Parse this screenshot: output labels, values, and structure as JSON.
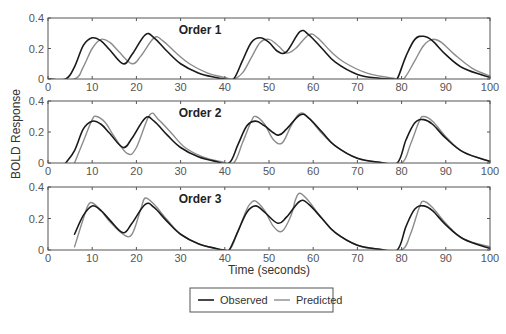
{
  "chart_data": {
    "type": "line",
    "ylabel": "BOLD Response",
    "xlabel": "Time (seconds)",
    "xlim": [
      0,
      100
    ],
    "ylim": [
      0,
      0.4
    ],
    "xticks": [
      0,
      10,
      20,
      30,
      40,
      50,
      60,
      70,
      80,
      90,
      100
    ],
    "xtick_labels": [
      "0",
      "10",
      "20",
      "30",
      "40",
      "50",
      "60",
      "70",
      "80",
      "90",
      "100"
    ],
    "yticks": [
      0,
      0.2,
      0.4
    ],
    "ytick_labels": [
      "0",
      "0.2",
      "0.4"
    ],
    "grid": false,
    "legend": {
      "position": "bottom-center",
      "entries": [
        {
          "label": "Observed",
          "color": "#1a1a1a"
        },
        {
          "label": "Predicted",
          "color": "#8c8c8c"
        }
      ]
    },
    "panels": [
      {
        "title": "Order 1",
        "series": [
          {
            "name": "Observed",
            "color": "#1a1a1a",
            "x": [
              0,
              4,
              6,
              8,
              10,
              12,
              14,
              17,
              19,
              22,
              24,
              27,
              30,
              34,
              38,
              40,
              42,
              44,
              46,
              48,
              50,
              52,
              54,
              57,
              59,
              62,
              65,
              70,
              75,
              78,
              79,
              81,
              83,
              85,
              87,
              90,
              94,
              100
            ],
            "y": [
              0,
              0,
              0.08,
              0.22,
              0.27,
              0.25,
              0.19,
              0.1,
              0.16,
              0.29,
              0.27,
              0.18,
              0.1,
              0.04,
              0.01,
              0,
              0,
              0.12,
              0.24,
              0.27,
              0.24,
              0.18,
              0.18,
              0.31,
              0.29,
              0.2,
              0.11,
              0.03,
              0.005,
              0,
              0,
              0.15,
              0.26,
              0.28,
              0.25,
              0.16,
              0.07,
              0.01
            ]
          },
          {
            "name": "Predicted",
            "color": "#8c8c8c",
            "x": [
              0,
              6,
              8,
              10,
              12,
              14,
              16,
              19,
              21,
              24,
              26,
              29,
              32,
              36,
              40,
              42,
              44,
              46,
              48,
              50,
              52,
              54,
              56,
              59,
              61,
              64,
              67,
              72,
              77,
              80,
              81,
              83,
              85,
              87,
              89,
              92,
              96,
              100
            ],
            "y": [
              0,
              0,
              0.08,
              0.2,
              0.26,
              0.24,
              0.18,
              0.1,
              0.15,
              0.27,
              0.25,
              0.17,
              0.1,
              0.04,
              0.01,
              0,
              0.04,
              0.14,
              0.24,
              0.26,
              0.22,
              0.17,
              0.2,
              0.29,
              0.27,
              0.18,
              0.11,
              0.04,
              0.01,
              0,
              0.02,
              0.12,
              0.22,
              0.26,
              0.24,
              0.16,
              0.07,
              0.02
            ]
          }
        ]
      },
      {
        "title": "Order 2",
        "series": [
          {
            "name": "Observed",
            "color": "#1a1a1a",
            "x": [
              4,
              6,
              8,
              10,
              12,
              14,
              17,
              19,
              22,
              24,
              27,
              30,
              34,
              38,
              41,
              43,
              45,
              47,
              49,
              52,
              54,
              57,
              59,
              62,
              65,
              70,
              75,
              79,
              81,
              83,
              85,
              87,
              90,
              94,
              100
            ],
            "y": [
              0,
              0.08,
              0.22,
              0.27,
              0.25,
              0.19,
              0.1,
              0.16,
              0.29,
              0.27,
              0.18,
              0.1,
              0.04,
              0.01,
              0,
              0.12,
              0.24,
              0.27,
              0.24,
              0.18,
              0.22,
              0.31,
              0.29,
              0.2,
              0.11,
              0.03,
              0.005,
              0,
              0.15,
              0.26,
              0.28,
              0.25,
              0.16,
              0.07,
              0.01
            ]
          },
          {
            "name": "Predicted",
            "color": "#8c8c8c",
            "x": [
              6,
              8,
              10,
              11,
              13,
              15,
              18,
              20,
              23,
              25,
              28,
              31,
              35,
              39,
              42,
              44,
              46,
              47,
              49,
              51,
              53,
              55,
              57,
              59,
              62,
              65,
              70,
              75,
              80,
              82,
              84,
              85,
              87,
              90,
              94,
              100
            ],
            "y": [
              0,
              0.14,
              0.28,
              0.3,
              0.26,
              0.17,
              0.06,
              0.1,
              0.31,
              0.28,
              0.19,
              0.1,
              0.04,
              0.01,
              0,
              0.13,
              0.27,
              0.3,
              0.25,
              0.15,
              0.13,
              0.24,
              0.32,
              0.29,
              0.19,
              0.11,
              0.03,
              0.005,
              0,
              0.12,
              0.27,
              0.3,
              0.27,
              0.17,
              0.07,
              0.01
            ]
          }
        ]
      },
      {
        "title": "Order 3",
        "series": [
          {
            "name": "Observed",
            "color": "#1a1a1a",
            "x": [
              6,
              8,
              10,
              12,
              14,
              17,
              19,
              22,
              24,
              27,
              30,
              34,
              38,
              40,
              41,
              43,
              45,
              47,
              49,
              52,
              54,
              57,
              59,
              62,
              65,
              70,
              75,
              79,
              81,
              83,
              85,
              87,
              90,
              94,
              100
            ],
            "y": [
              0.1,
              0.22,
              0.28,
              0.25,
              0.19,
              0.11,
              0.17,
              0.29,
              0.27,
              0.18,
              0.1,
              0.04,
              0.01,
              0,
              0,
              0.12,
              0.24,
              0.28,
              0.24,
              0.17,
              0.21,
              0.31,
              0.29,
              0.2,
              0.11,
              0.03,
              0.005,
              0,
              0.15,
              0.26,
              0.28,
              0.25,
              0.16,
              0.07,
              0.01
            ]
          },
          {
            "name": "Predicted",
            "color": "#8c8c8c",
            "x": [
              6,
              8,
              9,
              10,
              12,
              14,
              17,
              19,
              21,
              22,
              24,
              27,
              30,
              34,
              38,
              41,
              43,
              45,
              46,
              47,
              49,
              51,
              53,
              55,
              56,
              57,
              59,
              62,
              65,
              70,
              75,
              80,
              82,
              84,
              85,
              87,
              90,
              94,
              100
            ],
            "y": [
              0.02,
              0.2,
              0.28,
              0.3,
              0.25,
              0.18,
              0.1,
              0.1,
              0.26,
              0.33,
              0.29,
              0.19,
              0.1,
              0.04,
              0.01,
              0,
              0.12,
              0.26,
              0.3,
              0.31,
              0.25,
              0.15,
              0.12,
              0.22,
              0.32,
              0.36,
              0.31,
              0.2,
              0.11,
              0.03,
              0.005,
              0,
              0.1,
              0.27,
              0.31,
              0.27,
              0.17,
              0.07,
              0.02
            ]
          }
        ]
      }
    ]
  }
}
